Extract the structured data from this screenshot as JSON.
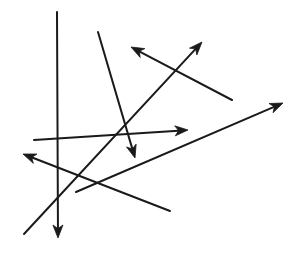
{
  "figure": {
    "background_color": "#ffffff",
    "stroke_color": "#1a1a1a",
    "width": 299,
    "height": 260
  },
  "chart_data": {
    "type": "scatter",
    "title": "",
    "xlabel": "",
    "ylabel": "",
    "xlim": [
      0,
      299
    ],
    "ylim": [
      0,
      260
    ],
    "grid": false,
    "legend": "none",
    "segments": [
      {
        "id": "segment-vertical-down",
        "label": "vertical line with downward arrowhead",
        "x1": 57,
        "y1": 12,
        "x2": 58,
        "y2": 238,
        "arrowhead": "end",
        "stroke_width": 2.0
      },
      {
        "id": "segment-steep-down",
        "label": "steep descending line with downward arrowhead",
        "x1": 98,
        "y1": 32,
        "x2": 135,
        "y2": 158,
        "arrowhead": "end",
        "stroke_width": 2.0
      },
      {
        "id": "segment-up-left",
        "label": "line ascending to the upper left with arrowhead",
        "x1": 232,
        "y1": 100,
        "x2": 131,
        "y2": 47,
        "arrowhead": "end",
        "stroke_width": 2.0
      },
      {
        "id": "segment-up-right",
        "label": "long line ascending to the upper right with arrowhead",
        "x1": 24,
        "y1": 234,
        "x2": 202,
        "y2": 42,
        "arrowhead": "end",
        "stroke_width": 2.0
      },
      {
        "id": "segment-right-horizontal",
        "label": "near-horizontal line pointing right with arrowhead",
        "x1": 34,
        "y1": 140,
        "x2": 188,
        "y2": 130,
        "arrowhead": "end",
        "stroke_width": 2.0
      },
      {
        "id": "segment-long-right",
        "label": "long shallow line ascending to the right with arrowhead",
        "x1": 76,
        "y1": 192,
        "x2": 283,
        "y2": 103,
        "arrowhead": "end",
        "stroke_width": 2.0
      },
      {
        "id": "segment-left",
        "label": "line pointing to the left with arrowhead",
        "x1": 170,
        "y1": 211,
        "x2": 23,
        "y2": 154,
        "arrowhead": "end",
        "stroke_width": 2.0
      }
    ],
    "arrowhead_count": 7,
    "segment_count": 7
  }
}
